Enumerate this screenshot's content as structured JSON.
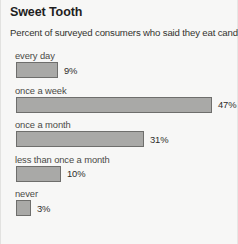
{
  "chart_data": {
    "type": "bar",
    "title": "Sweet Tooth",
    "subtitle": "Percent of surveyed consumers who said they eat candy:",
    "orientation": "horizontal",
    "xlabel": "",
    "ylabel": "",
    "xlim": [
      0,
      50
    ],
    "grid": false,
    "legend": "none",
    "unit": "%",
    "bar_color": "#a9a9a7",
    "bar_border_color": "#6e6e6c",
    "background_color": "#f7f7f6",
    "categories": [
      "every day",
      "once a week",
      "once a month",
      "less than once a month",
      "never"
    ],
    "values": [
      9,
      47,
      31,
      10,
      3
    ],
    "value_labels": [
      "9%",
      "47%",
      "31%",
      "10%",
      "3%"
    ],
    "bars": [
      {
        "label": "every day",
        "value": 9,
        "value_label": "9%",
        "px_width": 42
      },
      {
        "label": "once a week",
        "value": 47,
        "value_label": "47%",
        "px_width": 196
      },
      {
        "label": "once a month",
        "value": 31,
        "value_label": "31%",
        "px_width": 128
      },
      {
        "label": "less than once a month",
        "value": 10,
        "value_label": "10%",
        "px_width": 45
      },
      {
        "label": "never",
        "value": 3,
        "value_label": "3%",
        "px_width": 15
      }
    ]
  }
}
